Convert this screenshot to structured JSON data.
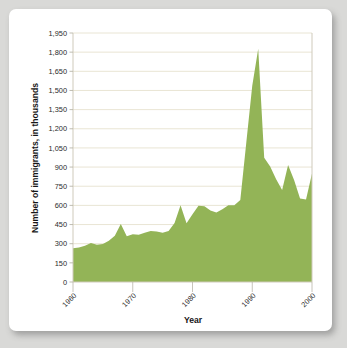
{
  "chart_data": {
    "type": "area",
    "title": "",
    "xlabel": "Year",
    "ylabel": "Number of immigrants, in thousands",
    "xlim": [
      1960,
      2000
    ],
    "ylim": [
      0,
      1950
    ],
    "grid": true,
    "legend": "none",
    "series_color": "#93b457",
    "gridline_color": "#e6e2cf",
    "background_color": "#ffffff",
    "page_background_color": "#d9d9d7",
    "ytick_labels": [
      "0",
      "150",
      "300",
      "450",
      "600",
      "750",
      "900",
      "1,050",
      "1,200",
      "1,350",
      "1,500",
      "1,650",
      "1,800",
      "1,950"
    ],
    "ytick_values": [
      0,
      150,
      300,
      450,
      600,
      750,
      900,
      1050,
      1200,
      1350,
      1500,
      1650,
      1800,
      1950
    ],
    "xtick_labels": [
      "1960",
      "1970",
      "1980",
      "1990",
      "2000"
    ],
    "xtick_values": [
      1960,
      1970,
      1980,
      1990,
      2000
    ],
    "x": [
      1960,
      1961,
      1962,
      1963,
      1964,
      1965,
      1966,
      1967,
      1968,
      1969,
      1970,
      1971,
      1972,
      1973,
      1974,
      1975,
      1976,
      1977,
      1978,
      1979,
      1980,
      1981,
      1982,
      1983,
      1984,
      1985,
      1986,
      1987,
      1988,
      1989,
      1990,
      1991,
      1992,
      1993,
      1994,
      1995,
      1996,
      1997,
      1998,
      1999,
      2000
    ],
    "values": [
      265,
      271,
      284,
      306,
      292,
      297,
      323,
      362,
      454,
      359,
      373,
      370,
      385,
      400,
      395,
      386,
      399,
      462,
      601,
      460,
      531,
      597,
      594,
      560,
      544,
      570,
      602,
      602,
      643,
      1091,
      1536,
      1827,
      974,
      904,
      804,
      721,
      916,
      798,
      654,
      647,
      850
    ],
    "annotations": []
  },
  "axes": {
    "x_title": "Year",
    "y_title": "Number of immigrants, in thousands"
  }
}
